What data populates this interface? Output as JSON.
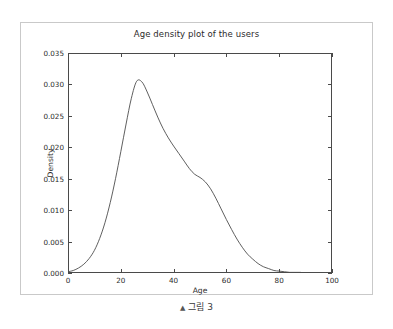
{
  "figure": {
    "caption_marker": "▲",
    "caption_text": "그림 3"
  },
  "chart_data": {
    "type": "line",
    "title": "Age density plot of the users",
    "xlabel": "Age",
    "ylabel": "Density",
    "xlim": [
      0,
      100
    ],
    "ylim": [
      0,
      0.035
    ],
    "grid": false,
    "legend": null,
    "line_color": "#4d4d4d",
    "xticks": [
      0,
      20,
      40,
      60,
      80,
      100
    ],
    "xtick_labels": [
      "0",
      "20",
      "40",
      "60",
      "80",
      "100"
    ],
    "yticks": [
      0.0,
      0.005,
      0.01,
      0.015,
      0.02,
      0.025,
      0.03,
      0.035
    ],
    "ytick_labels": [
      "0.000",
      "0.005",
      "0.010",
      "0.015",
      "0.020",
      "0.025",
      "0.030",
      "0.035"
    ],
    "peak": {
      "x": 26,
      "y": 0.0306
    },
    "series": [
      {
        "name": "Age density",
        "x": [
          0,
          2,
          4,
          6,
          8,
          10,
          12,
          14,
          16,
          18,
          20,
          22,
          24,
          26,
          28,
          30,
          32,
          34,
          36,
          38,
          40,
          42,
          44,
          46,
          48,
          50,
          52,
          54,
          56,
          58,
          60,
          62,
          64,
          66,
          68,
          70,
          72,
          74,
          76,
          78,
          80,
          82,
          84,
          86,
          88,
          90,
          92,
          94,
          96,
          98,
          100
        ],
        "y": [
          0.0002,
          0.0004,
          0.0008,
          0.0014,
          0.0023,
          0.0036,
          0.0055,
          0.008,
          0.0112,
          0.015,
          0.0193,
          0.0237,
          0.0278,
          0.0305,
          0.0304,
          0.0288,
          0.0268,
          0.0248,
          0.023,
          0.0215,
          0.0202,
          0.019,
          0.0178,
          0.0166,
          0.0157,
          0.0152,
          0.0145,
          0.0134,
          0.0119,
          0.0102,
          0.0085,
          0.0069,
          0.0054,
          0.0041,
          0.003,
          0.0022,
          0.0015,
          0.001,
          0.0007,
          0.0004,
          0.0003,
          0.0002,
          0.0001,
          0.0001,
          0.0001,
          0.0,
          0.0,
          0.0,
          0.0,
          0.0,
          0.0
        ]
      }
    ]
  }
}
